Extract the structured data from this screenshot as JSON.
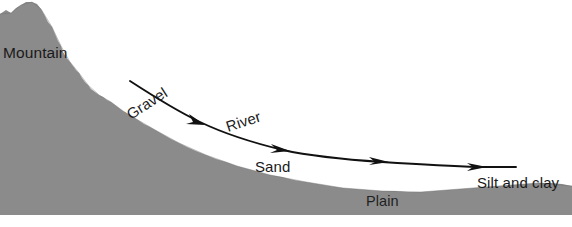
{
  "diagram": {
    "background_color": "#ffffff",
    "terrain_color": "#8b8b8b",
    "line_color": "#111111",
    "width": 572,
    "height": 227,
    "labels": {
      "mountain": "Mountain",
      "gravel": "Gravel",
      "river": "River",
      "sand": "Sand",
      "plain": "Plain",
      "silt_and_clay": "Silt and clay"
    },
    "label_positions": {
      "mountain": {
        "x": 3,
        "y": 58,
        "rotation": 0
      },
      "gravel": {
        "x": 131,
        "y": 120,
        "rotation": -33
      },
      "river": {
        "x": 228,
        "y": 132,
        "rotation": -18
      },
      "sand": {
        "x": 255,
        "y": 172,
        "rotation": 0
      },
      "plain": {
        "x": 366,
        "y": 206,
        "rotation": 0
      },
      "silt_and_clay": {
        "x": 477,
        "y": 188,
        "rotation": 0
      }
    },
    "arrow_count": 4,
    "arrow_positions": [
      {
        "x": 200,
        "y": 122
      },
      {
        "x": 283,
        "y": 150
      },
      {
        "x": 382,
        "y": 158
      },
      {
        "x": 478,
        "y": 165
      }
    ]
  }
}
